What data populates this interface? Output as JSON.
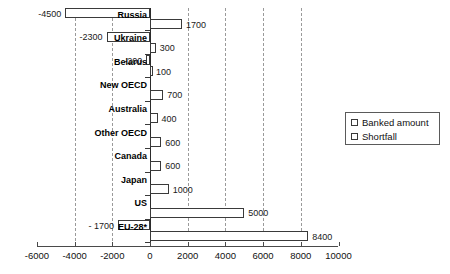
{
  "chart_data": {
    "type": "bar",
    "orientation": "horizontal",
    "title": "",
    "xlabel": "",
    "ylabel": "",
    "xlim": [
      -6000,
      10000
    ],
    "xticks": [
      -6000,
      -4000,
      -2000,
      0,
      2000,
      4000,
      6000,
      8000,
      10000
    ],
    "xtick_labels": [
      "-6000",
      "-4000",
      "-2000",
      "0",
      "2000",
      "4000",
      "6000",
      "8000",
      "10000"
    ],
    "grid": "vertical",
    "gridlines": [
      -4000,
      -2000,
      2000,
      4000,
      6000,
      8000
    ],
    "legend_position": "right",
    "categories": [
      "Russia",
      "Ukraine",
      "Belarus",
      "New OECD",
      "Australia",
      "Other OECD",
      "Canada",
      "Japan",
      "US",
      "EU-28*"
    ],
    "series": [
      {
        "name": "Banked amount",
        "values": [
          1700,
          300,
          100,
          700,
          400,
          600,
          600,
          1000,
          5000,
          8400
        ],
        "labels": [
          "1700",
          "300",
          "100",
          "700",
          "400",
          "600",
          "600",
          "1000",
          "5000",
          "8400"
        ]
      },
      {
        "name": "Shortfall",
        "values": [
          -4500,
          -2300,
          -200,
          0,
          0,
          0,
          0,
          0,
          0,
          -1700
        ],
        "labels": [
          "-4500",
          "-2300",
          "-200",
          "",
          "",
          "",
          "",
          "",
          "",
          "- 1700"
        ]
      }
    ]
  },
  "legend": {
    "items": [
      {
        "label": "Banked amount"
      },
      {
        "label": "Shortfall"
      }
    ]
  },
  "axis": {
    "ticks": [
      {
        "value": -6000,
        "label": "-6000"
      },
      {
        "value": -4000,
        "label": "-4000"
      },
      {
        "value": -2000,
        "label": "-2000"
      },
      {
        "value": 0,
        "label": "0"
      },
      {
        "value": 2000,
        "label": "2000"
      },
      {
        "value": 4000,
        "label": "4000"
      },
      {
        "value": 6000,
        "label": "6000"
      },
      {
        "value": 8000,
        "label": "8000"
      },
      {
        "value": 10000,
        "label": "10000"
      }
    ]
  }
}
